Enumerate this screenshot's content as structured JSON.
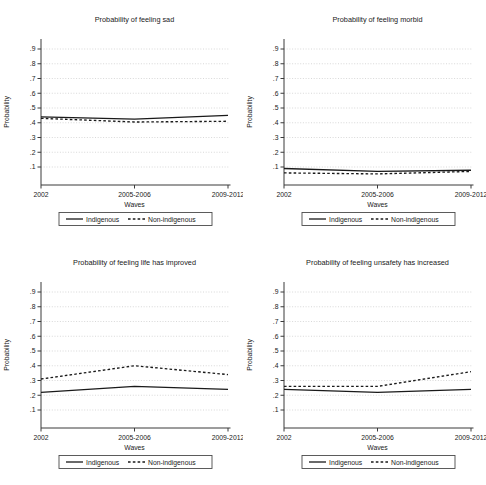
{
  "page": {
    "background": "#ffffff"
  },
  "colors": {
    "line": "#1a1a1a",
    "grid": "#d4d4d4",
    "axis": "#3a3a3a",
    "text": "#1a1a1a",
    "legend_border": "#4a4a4a"
  },
  "legend": {
    "items": [
      {
        "label": "Indigenous",
        "style": "solid"
      },
      {
        "label": "Non-indigenous",
        "style": "dashed"
      }
    ]
  },
  "chart_data": [
    {
      "type": "line",
      "title": "Probability of feeling sad",
      "xlabel": "Waves",
      "ylabel": "Probability",
      "categories": [
        "2002",
        "2005-2006",
        "2009-2012"
      ],
      "series": [
        {
          "name": "Indigenous",
          "style": "solid",
          "values": [
            0.44,
            0.425,
            0.45
          ]
        },
        {
          "name": "Non-indigenous",
          "style": "dashed",
          "values": [
            0.43,
            0.405,
            0.41
          ]
        }
      ],
      "ylim": [
        0,
        1
      ],
      "yticks": [
        0.1,
        0.2,
        0.3,
        0.4,
        0.5,
        0.6,
        0.7,
        0.8,
        0.9
      ],
      "ytick_labels": [
        ".1",
        ".2",
        ".3",
        ".4",
        ".5",
        ".6",
        ".7",
        ".8",
        ".9"
      ],
      "grid": true,
      "legend_position": "bottom"
    },
    {
      "type": "line",
      "title": "Probability of feeling morbid",
      "xlabel": "Waves",
      "ylabel": "Probability",
      "categories": [
        "2002",
        "2005-2006",
        "2009-2012"
      ],
      "series": [
        {
          "name": "Indigenous",
          "style": "solid",
          "values": [
            0.09,
            0.07,
            0.078
          ]
        },
        {
          "name": "Non-indigenous",
          "style": "dashed",
          "values": [
            0.06,
            0.053,
            0.07
          ]
        }
      ],
      "ylim": [
        0,
        1
      ],
      "yticks": [
        0.1,
        0.2,
        0.3,
        0.4,
        0.5,
        0.6,
        0.7,
        0.8,
        0.9
      ],
      "ytick_labels": [
        ".1",
        ".2",
        ".3",
        ".4",
        ".5",
        ".6",
        ".7",
        ".8",
        ".9"
      ],
      "grid": true,
      "legend_position": "bottom"
    },
    {
      "type": "line",
      "title": "Probability of feeling life has improved",
      "xlabel": "Waves",
      "ylabel": "Probability",
      "categories": [
        "2002",
        "2005-2006",
        "2009-2012"
      ],
      "series": [
        {
          "name": "Indigenous",
          "style": "solid",
          "values": [
            0.22,
            0.26,
            0.24
          ]
        },
        {
          "name": "Non-indigenous",
          "style": "dashed",
          "values": [
            0.31,
            0.4,
            0.34
          ]
        }
      ],
      "ylim": [
        0,
        1
      ],
      "yticks": [
        0.1,
        0.2,
        0.3,
        0.4,
        0.5,
        0.6,
        0.7,
        0.8,
        0.9
      ],
      "ytick_labels": [
        ".1",
        ".2",
        ".3",
        ".4",
        ".5",
        ".6",
        ".7",
        ".8",
        ".9"
      ],
      "grid": true,
      "legend_position": "bottom"
    },
    {
      "type": "line",
      "title": "Probability of feeling unsafety has increased",
      "xlabel": "Waves",
      "ylabel": "Probability",
      "categories": [
        "2002",
        "2005-2006",
        "2009-2012"
      ],
      "series": [
        {
          "name": "Indigenous",
          "style": "solid",
          "values": [
            0.24,
            0.22,
            0.24
          ]
        },
        {
          "name": "Non-indigenous",
          "style": "dashed",
          "values": [
            0.26,
            0.26,
            0.36
          ]
        }
      ],
      "ylim": [
        0,
        1
      ],
      "yticks": [
        0.1,
        0.2,
        0.3,
        0.4,
        0.5,
        0.6,
        0.7,
        0.8,
        0.9
      ],
      "ytick_labels": [
        ".1",
        ".2",
        ".3",
        ".4",
        ".5",
        ".6",
        ".7",
        ".8",
        ".9"
      ],
      "grid": true,
      "legend_position": "bottom"
    }
  ]
}
